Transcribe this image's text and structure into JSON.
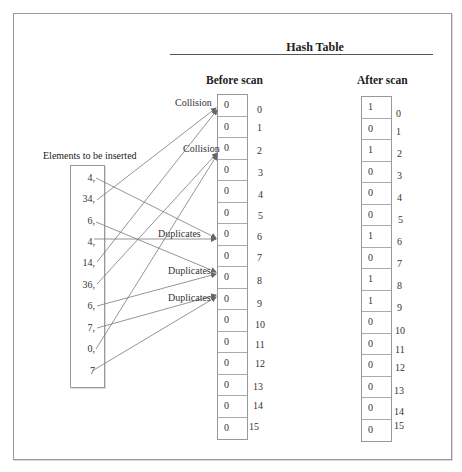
{
  "title": "Hash Table",
  "elements_label": "Elements to be inserted",
  "elements": [
    "4,",
    "34,",
    "6,",
    "4,",
    "14,",
    "36,",
    "6,",
    "7,",
    "0,",
    "7"
  ],
  "before": {
    "heading": "Before scan",
    "values": [
      "0",
      "0",
      "0",
      "0",
      "0",
      "0",
      "0",
      "0",
      "0",
      "0",
      "0",
      "0",
      "0",
      "0",
      "0",
      "0"
    ]
  },
  "after": {
    "heading": "After scan",
    "values": [
      "1",
      "0",
      "1",
      "0",
      "0",
      "0",
      "1",
      "0",
      "1",
      "1",
      "0",
      "0",
      "0",
      "0",
      "0",
      "0"
    ]
  },
  "indices": [
    "0",
    "1",
    "2",
    "3",
    "4",
    "5",
    "6",
    "7",
    "8",
    "9",
    "10",
    "11",
    "12",
    "13",
    "14",
    "15"
  ],
  "annotations": {
    "collision_0": "Collision",
    "collision_2": "Collision",
    "duplicates_6": "Duplicates",
    "duplicates_8": "Duplicates",
    "duplicates_9": "Duplicates"
  },
  "mappings": [
    {
      "element": "4,",
      "slot": 6
    },
    {
      "element": "34,",
      "slot": 0
    },
    {
      "element": "6,",
      "slot": 8
    },
    {
      "element": "4,",
      "slot": 6
    },
    {
      "element": "14,",
      "slot": 0
    },
    {
      "element": "36,",
      "slot": 2
    },
    {
      "element": "6,",
      "slot": 8
    },
    {
      "element": "7,",
      "slot": 9
    },
    {
      "element": "0,",
      "slot": 2
    },
    {
      "element": "7",
      "slot": 9
    }
  ],
  "colors": {
    "line": "#777777",
    "border": "#999999",
    "text": "#333333"
  }
}
